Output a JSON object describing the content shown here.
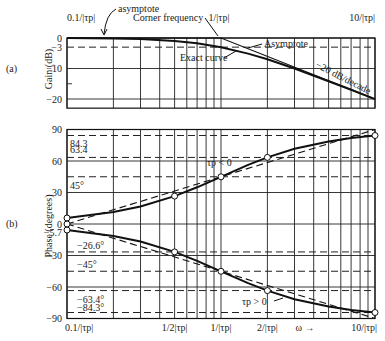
{
  "chart_data": [
    {
      "id": "gain",
      "type": "line",
      "panel_label": "(a)",
      "ylabel": "Gain (dB)",
      "xscale": "log",
      "xlim": [
        0.1,
        10
      ],
      "ylim": [
        -23,
        0
      ],
      "x_units": "1/|τp|",
      "yticks": [
        {
          "value": 0,
          "label": "0"
        },
        {
          "value": -3,
          "label": "−3"
        },
        {
          "value": -10,
          "label": "−10"
        },
        {
          "value": -20,
          "label": "−20"
        }
      ],
      "top_x_labels": [
        {
          "value": 0.1,
          "label": "0.1/|τp|"
        },
        {
          "value": 1,
          "label": "1/|τp|"
        },
        {
          "value": 10,
          "label": "10/|τp|"
        }
      ],
      "dashed_reference": [
        -3
      ],
      "series": [
        {
          "name": "Exact curve",
          "style": "solid",
          "x": [
            0.1,
            0.2,
            0.3,
            0.5,
            0.7,
            1,
            1.5,
            2,
            3,
            5,
            7,
            10
          ],
          "y": [
            -0.04,
            -0.17,
            -0.37,
            -0.97,
            -1.73,
            -3.01,
            -5.12,
            -6.99,
            -10.0,
            -14.15,
            -16.99,
            -20.04
          ]
        },
        {
          "name": "Asymptote",
          "style": "solid",
          "x": [
            0.1,
            1,
            10
          ],
          "y": [
            0,
            0,
            -20
          ]
        }
      ],
      "annotations": [
        {
          "text": "asymptote",
          "at": [
            0.35,
            0
          ]
        },
        {
          "text": "Corner frequency",
          "at": [
            1,
            0
          ]
        },
        {
          "text": "Asymptote",
          "at": [
            1.8,
            -5
          ]
        },
        {
          "text": "Exact curve",
          "at": [
            0.9,
            -4
          ]
        },
        {
          "text": "−20 dB/decade",
          "at": [
            5,
            -14
          ]
        }
      ]
    },
    {
      "id": "phase",
      "type": "line",
      "panel_label": "(b)",
      "ylabel": "Phase (degrees)",
      "xlabel": "ω →",
      "xscale": "log",
      "xlim": [
        0.1,
        10
      ],
      "ylim": [
        -90,
        90
      ],
      "yticks": [
        {
          "value": 90,
          "label": "90"
        },
        {
          "value": 60,
          "label": "60"
        },
        {
          "value": 30,
          "label": "30"
        },
        {
          "value": 0,
          "label": "0"
        },
        {
          "value": -30,
          "label": "−30"
        },
        {
          "value": -60,
          "label": "−60"
        },
        {
          "value": -90,
          "label": "−90"
        }
      ],
      "bottom_x_labels": [
        {
          "value": 0.1,
          "label": "0.1/|τp|"
        },
        {
          "value": 0.5,
          "label": "1/2|τp|"
        },
        {
          "value": 1,
          "label": "1/|τp|"
        },
        {
          "value": 2,
          "label": "2/|τp|"
        },
        {
          "value": 10,
          "label": "10/|τp|"
        }
      ],
      "reference_values": [
        {
          "value": 84.3,
          "label": "84.3"
        },
        {
          "value": 63.4,
          "label": "63.4"
        },
        {
          "value": 45,
          "label": "45°"
        },
        {
          "value": -5.7,
          "label": "−5.7"
        },
        {
          "value": -26.6,
          "label": "−26.6°"
        },
        {
          "value": -45,
          "label": "−45°"
        },
        {
          "value": -63.4,
          "label": "−63.4°"
        },
        {
          "value": -84.3,
          "label": "−84.3°"
        }
      ],
      "series": [
        {
          "name": "τp < 0 (exact)",
          "style": "solid",
          "x": [
            0.1,
            0.2,
            0.3,
            0.5,
            0.7,
            1,
            1.5,
            2,
            3,
            5,
            7,
            10
          ],
          "y": [
            5.7,
            11.3,
            16.7,
            26.6,
            35.0,
            45.0,
            56.3,
            63.4,
            71.6,
            78.7,
            81.9,
            84.3
          ]
        },
        {
          "name": "τp > 0 (exact)",
          "style": "solid",
          "x": [
            0.1,
            0.2,
            0.3,
            0.5,
            0.7,
            1,
            1.5,
            2,
            3,
            5,
            7,
            10
          ],
          "y": [
            -5.7,
            -11.3,
            -16.7,
            -26.6,
            -35.0,
            -45.0,
            -56.3,
            -63.4,
            -71.6,
            -78.7,
            -81.9,
            -84.3
          ]
        },
        {
          "name": "τp < 0 (asymptote)",
          "style": "dashed",
          "x": [
            0.1,
            10
          ],
          "y": [
            0,
            90
          ]
        },
        {
          "name": "τp > 0 (asymptote)",
          "style": "dashed",
          "x": [
            0.1,
            10
          ],
          "y": [
            0,
            -90
          ]
        }
      ],
      "marked_points": [
        {
          "x": 0.1,
          "y": 5.7
        },
        {
          "x": 0.5,
          "y": 26.6
        },
        {
          "x": 1,
          "y": 45
        },
        {
          "x": 2,
          "y": 63.4
        },
        {
          "x": 10,
          "y": 84.3
        },
        {
          "x": 0.1,
          "y": -5.7
        },
        {
          "x": 0.5,
          "y": -26.6
        },
        {
          "x": 1,
          "y": -45
        },
        {
          "x": 2,
          "y": -63.4
        },
        {
          "x": 10,
          "y": -84.3
        }
      ],
      "annotations": [
        {
          "text": "τp < 0",
          "at": [
            1.3,
            50
          ]
        },
        {
          "text": "τp > 0",
          "at": [
            2.2,
            -75
          ]
        }
      ]
    }
  ]
}
